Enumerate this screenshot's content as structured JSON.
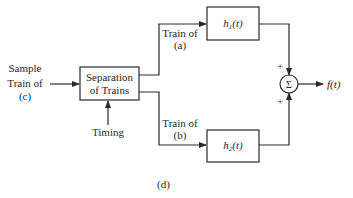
{
  "diagram": {
    "input_label": [
      "Sample",
      "Train of",
      "(c)"
    ],
    "separation_block": [
      "Separation",
      "of Trains"
    ],
    "timing_label": "Timing",
    "branch_a_label": [
      "Train of",
      "(a)"
    ],
    "branch_b_label": [
      "Train of",
      "(b)"
    ],
    "filter_1": {
      "h": "h",
      "sub": "1",
      "arg": "(t)"
    },
    "filter_2": {
      "h": "h",
      "sub": "2",
      "arg": "(t)"
    },
    "summer_symbol": "Σ",
    "summer_signs": [
      "+",
      "+"
    ],
    "output_label": "f(t)",
    "caption": "(d)",
    "line_color": "#2a2a2a"
  }
}
